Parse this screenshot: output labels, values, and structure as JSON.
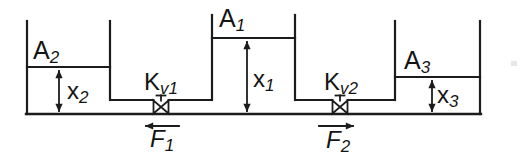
{
  "diagram": {
    "type": "three-tank hydraulic system schematic",
    "colors": {
      "line": "#1c1c1c",
      "text": "#141414",
      "background": "#ffffff"
    },
    "labels": {
      "area_middle": {
        "main": "A",
        "sub": "1"
      },
      "area_left": {
        "main": "A",
        "sub": "2"
      },
      "area_right": {
        "main": "A",
        "sub": "3"
      },
      "valve_left": {
        "main": "K",
        "sub": "v1"
      },
      "valve_right": {
        "main": "K",
        "sub": "v2"
      },
      "level_middle": {
        "main": "x",
        "sub": "1"
      },
      "level_left": {
        "main": "x",
        "sub": "2"
      },
      "level_right": {
        "main": "x",
        "sub": "3"
      },
      "flow_left": {
        "main": "F",
        "sub": "1"
      },
      "flow_right": {
        "main": "F",
        "sub": "2"
      }
    },
    "flows": {
      "flow_left_direction": "left",
      "flow_right_direction": "right"
    }
  }
}
